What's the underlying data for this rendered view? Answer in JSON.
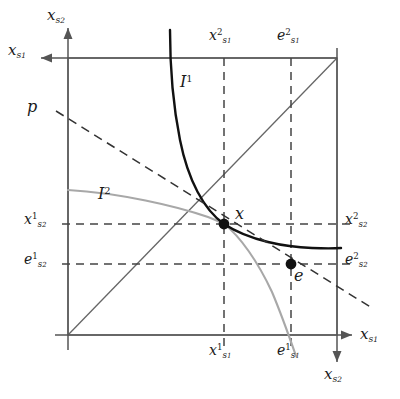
{
  "figure": {
    "type": "edgeworth-box-diagram",
    "background_color": "#ffffff",
    "ink_color": "#1a1a1a",
    "box_color": "#6e6e6e",
    "curve1_color": "#000000",
    "curve2_color": "#a0a0a0"
  },
  "axes": {
    "origin1": {
      "x_axis_label": {
        "base": "x",
        "sub": "s",
        "subsub": "1"
      },
      "y_axis_label": {
        "base": "x",
        "sub": "s",
        "subsub": "2"
      }
    },
    "origin2": {
      "x_axis_label": {
        "base": "x",
        "sub": "s",
        "subsub": "1"
      },
      "y_axis_label": {
        "base": "x",
        "sub": "s",
        "subsub": "2"
      }
    },
    "labels": {
      "axis_top_left_x": "x",
      "axis_top_left_x_sub": "s1",
      "axis_top_left_y": "x",
      "axis_top_left_y_sub": "s2",
      "axis_bottom_right_x": "x",
      "axis_bottom_right_x_sub": "s1",
      "axis_bottom_right_y": "x",
      "axis_bottom_right_y_sub": "s2"
    }
  },
  "tick_labels": {
    "top_left": {
      "base": "x",
      "sup": "2",
      "sub": "s",
      "subsub": "1",
      "text": "x²s1"
    },
    "top_right": {
      "base": "e",
      "sup": "2",
      "sub": "s",
      "subsub": "1",
      "text": "e²s1"
    },
    "bottom_left": {
      "base": "x",
      "sup": "1",
      "sub": "s",
      "subsub": "1",
      "text": "x¹s1"
    },
    "bottom_right": {
      "base": "e",
      "sup": "1",
      "sub": "s",
      "subsub": "1",
      "text": "e¹s1"
    },
    "left_upper": {
      "base": "x",
      "sup": "1",
      "sub": "s",
      "subsub": "2",
      "text": "x¹s2"
    },
    "left_lower": {
      "base": "e",
      "sup": "1",
      "sub": "s",
      "subsub": "2",
      "text": "e¹s2"
    },
    "right_upper": {
      "base": "x",
      "sup": "2",
      "sub": "s",
      "subsub": "2",
      "text": "x²s2"
    },
    "right_lower": {
      "base": "e",
      "sup": "2",
      "sub": "s",
      "subsub": "2",
      "text": "e²s2"
    }
  },
  "curves": [
    {
      "name": "indifference-curve-1",
      "label_base": "I",
      "label_sup": "1",
      "color": "#000000",
      "stroke_width": 2.2,
      "description": "agent 1 indifference curve, convex to lower-left origin",
      "label_pos": {
        "x": 186,
        "y": 83
      }
    },
    {
      "name": "indifference-curve-2",
      "label_base": "I",
      "label_sup": "2",
      "color": "#a0a0a0",
      "stroke_width": 2.0,
      "description": "agent 2 indifference curve, convex to upper-right origin",
      "label_pos": {
        "x": 104,
        "y": 196
      }
    }
  ],
  "price_line": {
    "name": "budget-price-line",
    "label": "p",
    "style": "dashed",
    "label_pos": {
      "x": 30,
      "y": 105
    }
  },
  "points": [
    {
      "name": "equilibrium-allocation",
      "label": "x",
      "cx": 224,
      "cy": 224,
      "r": 5.2
    },
    {
      "name": "endowment-allocation",
      "label": "e",
      "cx": 291,
      "cy": 264,
      "r": 5.2
    }
  ],
  "box": {
    "left": 68,
    "top": 58,
    "right": 337,
    "bottom": 335,
    "diagonal": "contract-curve-diagonal"
  },
  "guide_lines": {
    "vertical": [
      224,
      291
    ],
    "horizontal": [
      224,
      264
    ]
  }
}
